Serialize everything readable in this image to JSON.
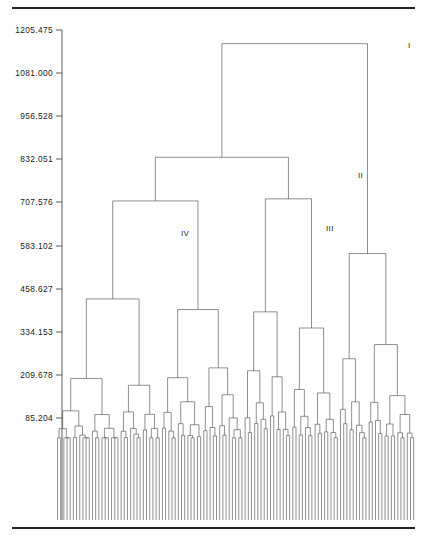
{
  "figure": {
    "type": "dendrogram",
    "background_color": "#ffffff",
    "line_color": "#4a4a4a",
    "rule_color": "#222222",
    "width": 427,
    "height": 539
  },
  "rules": {
    "top": {
      "y": 8,
      "x1": 12,
      "x2": 415,
      "thickness": 2.2
    },
    "bottom": {
      "y": 528,
      "x1": 12,
      "x2": 415,
      "thickness": 2.2
    }
  },
  "axis": {
    "orientation": "vertical-left",
    "x": 62,
    "y_top": 30,
    "y_bottom": 520,
    "tick_length": 6,
    "labels": [
      "1205.475",
      "1081.000",
      "956.528",
      "832.051",
      "707.576",
      "583.102",
      "458.627",
      "334.153",
      "209.678",
      "85.204"
    ],
    "values": [
      1205.475,
      1081.0,
      956.528,
      832.051,
      707.576,
      583.102,
      458.627,
      334.153,
      209.678,
      85.204
    ],
    "tick_y": [
      30,
      73,
      116,
      159,
      202,
      246,
      289,
      332,
      375,
      418
    ]
  },
  "cluster_labels": [
    {
      "text": "I",
      "x": 408,
      "y": 48
    },
    {
      "text": "II",
      "x": 358,
      "y": 178
    },
    {
      "text": "III",
      "x": 326,
      "y": 231
    },
    {
      "text": "IV",
      "x": 181,
      "y": 236
    }
  ],
  "chart_data": {
    "type": "dendrogram",
    "title": "",
    "xlabel": "",
    "ylabel": "",
    "ylim": [
      0,
      1205.475
    ],
    "grid": false,
    "legend": "none",
    "n_leaves": 113,
    "leaf_x_start": 57.5,
    "leaf_x_end": 414,
    "leaf_spacing": 3.18,
    "leaf_baseline_y": 520,
    "axis_tick_values": [
      1205.475,
      1081.0,
      956.528,
      832.051,
      707.576,
      583.102,
      458.627,
      334.153,
      209.678,
      85.204
    ],
    "named_clusters": [
      "I",
      "II",
      "III",
      "IV"
    ],
    "merge_heights_named": {
      "I": 1166.0,
      "II": 838.0,
      "III": 718.0,
      "IV": 712.0
    }
  }
}
